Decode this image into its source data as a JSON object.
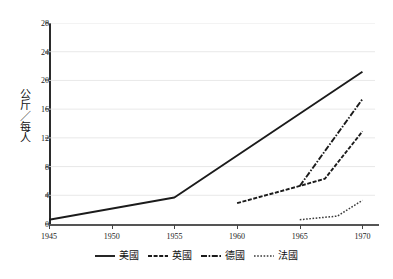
{
  "chart_data": {
    "type": "line",
    "title": "",
    "xlabel": "",
    "ylabel": "公斤／每人",
    "xlim": [
      1945,
      1971
    ],
    "ylim": [
      0,
      28
    ],
    "grid": true,
    "legend_position": "bottom",
    "x_ticks": [
      "1945",
      "1950",
      "1955",
      "1960",
      "1965",
      "1970"
    ],
    "x_tick_values": [
      1945,
      1950,
      1955,
      1960,
      1965,
      1970
    ],
    "y_ticks": [
      "0",
      "4",
      "8",
      "12",
      "16",
      "20",
      "24",
      "28"
    ],
    "y_tick_values": [
      0,
      4,
      8,
      12,
      16,
      20,
      24,
      28
    ],
    "series": [
      {
        "name": "美國",
        "style": "solid",
        "color": "#1b1b1b",
        "x": [
          1945,
          1955,
          1970
        ],
        "values": [
          0.6,
          3.7,
          21.2
        ]
      },
      {
        "name": "英國",
        "style": "dashed",
        "color": "#1b1b1b",
        "x": [
          1960,
          1965,
          1967,
          1970
        ],
        "values": [
          2.9,
          5.3,
          6.3,
          12.9
        ]
      },
      {
        "name": "德國",
        "style": "dashdot",
        "color": "#1b1b1b",
        "x": [
          1965,
          1970
        ],
        "values": [
          5.3,
          17.4
        ]
      },
      {
        "name": "法國",
        "style": "dotted",
        "color": "#3a3a3a",
        "x": [
          1965,
          1968,
          1970
        ],
        "values": [
          0.6,
          1.1,
          3.3
        ]
      }
    ]
  },
  "legend": {
    "items": [
      {
        "label": "美國",
        "swatch": "line-solid-icon"
      },
      {
        "label": "英國",
        "swatch": "line-dashed-icon"
      },
      {
        "label": "德國",
        "swatch": "line-dashdot-icon"
      },
      {
        "label": "法國",
        "swatch": "line-dotted-icon"
      }
    ]
  }
}
